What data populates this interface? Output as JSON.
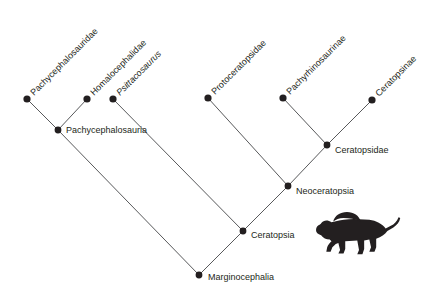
{
  "figure": {
    "type": "cladogram",
    "background_color": "#ffffff",
    "line_color": "#58595b",
    "node_color": "#231f20",
    "text_color": "#231f20"
  },
  "chart_data": {
    "type": "diagram",
    "title": "",
    "xlabel": "",
    "ylabel": "",
    "tips": [
      {
        "id": "pachycephalosauridae",
        "label": "Pachycephalosauridae",
        "italic": false,
        "x": 27,
        "y": 99,
        "label_angle": -45
      },
      {
        "id": "homalocephalidae",
        "label": "Homalocephalidae",
        "italic": false,
        "x": 87,
        "y": 99,
        "label_angle": -45
      },
      {
        "id": "psittacosaurus",
        "label": "Psittacosaurus",
        "italic": true,
        "x": 113,
        "y": 99,
        "label_angle": -45
      },
      {
        "id": "protoceratopsidae",
        "label": "Protoceratopsidae",
        "italic": false,
        "x": 208,
        "y": 98,
        "label_angle": -45
      },
      {
        "id": "pachyrhinosaurinae",
        "label": "Pachyrhinosaurinae",
        "italic": false,
        "x": 283,
        "y": 98,
        "label_angle": -45
      },
      {
        "id": "ceratopsinae",
        "label": "Ceratopsinae",
        "italic": false,
        "x": 372,
        "y": 100,
        "label_angle": -45
      }
    ],
    "internal_nodes": [
      {
        "id": "pachycephalosauria",
        "label": "Pachycephalosauria",
        "x": 58,
        "y": 130,
        "label_dx": 8,
        "label_dy": 1
      },
      {
        "id": "ceratopsidae",
        "label": "Ceratopsidae",
        "x": 327,
        "y": 145,
        "label_dx": 8,
        "label_dy": 6
      },
      {
        "id": "neoceratopsia",
        "label": "Neoceratopsia",
        "x": 288,
        "y": 186,
        "label_dx": 8,
        "label_dy": 6
      },
      {
        "id": "ceratopsia",
        "label": "Ceratopsia",
        "x": 243,
        "y": 231,
        "label_dx": 8,
        "label_dy": 5
      },
      {
        "id": "marginocephalia",
        "label": "Marginocephalia",
        "x": 199,
        "y": 275,
        "label_dx": 9,
        "label_dy": 3
      }
    ],
    "edges": [
      {
        "from": "pachycephalosauria",
        "to": "pachycephalosauridae"
      },
      {
        "from": "pachycephalosauria",
        "to": "homalocephalidae"
      },
      {
        "from": "marginocephalia",
        "to": "pachycephalosauria"
      },
      {
        "from": "ceratopsia",
        "to": "psittacosaurus"
      },
      {
        "from": "marginocephalia",
        "to": "ceratopsia"
      },
      {
        "from": "ceratopsia",
        "to": "neoceratopsia"
      },
      {
        "from": "neoceratopsia",
        "to": "protoceratopsidae"
      },
      {
        "from": "neoceratopsia",
        "to": "ceratopsidae"
      },
      {
        "from": "ceratopsidae",
        "to": "pachyrhinosaurinae"
      },
      {
        "from": "ceratopsidae",
        "to": "ceratopsinae"
      }
    ],
    "silhouette": {
      "id": "ceratopsian-silhouette",
      "description": "ceratopsian-dinosaur-silhouette",
      "x": 316,
      "y": 212,
      "width": 86,
      "height": 50
    }
  }
}
